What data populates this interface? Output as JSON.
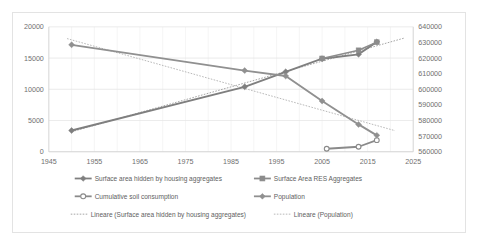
{
  "figure": {
    "background_color": "#ffffff",
    "border_color": "#e3e3e3"
  },
  "chart_data": {
    "type": "line",
    "title": "",
    "subtitle": "",
    "xlabel": "",
    "ylabel": "",
    "y2label": "",
    "xlim": [
      1945,
      2025
    ],
    "xticks": [
      1945,
      1955,
      1965,
      1975,
      1985,
      1995,
      2005,
      2015,
      2025
    ],
    "xticklabels": [
      "1945",
      "1955",
      "1965",
      "1975",
      "1985",
      "1995",
      "2005",
      "2015",
      "2025"
    ],
    "ylim": [
      0,
      20000
    ],
    "yticks": [
      0,
      5000,
      10000,
      15000,
      20000
    ],
    "yticklabels": [
      "0",
      "5000",
      "10000",
      "15000",
      "20000"
    ],
    "y2lim": [
      560000,
      640000
    ],
    "y2ticks": [
      560000,
      570000,
      580000,
      590000,
      600000,
      610000,
      620000,
      630000,
      640000
    ],
    "y2ticklabels": [
      "560000",
      "570000",
      "580000",
      "590000",
      "600000",
      "610000",
      "620000",
      "630000",
      "640000"
    ],
    "grid": true,
    "grid_axis": "both",
    "legend_position": "bottom",
    "series": [
      {
        "name": "Surface area hidden by housing aggregates",
        "axis": "left",
        "color": "#7f7f7f",
        "line_width": 1.9,
        "marker": "diamond",
        "marker_size": 2.6,
        "x": [
          1950,
          1988,
          1997,
          2005,
          2013,
          2017
        ],
        "values": [
          3400,
          10400,
          12800,
          14900,
          15600,
          17600
        ]
      },
      {
        "name": "Surface Area RES Aggregates",
        "axis": "left",
        "color": "#8c8c8c",
        "line_width": 1.6,
        "marker": "square",
        "marker_size": 2.4,
        "x": [
          2005,
          2013,
          2017
        ],
        "values": [
          14950,
          16250,
          17550
        ]
      },
      {
        "name": "Cumulative soil consumption",
        "axis": "left",
        "color": "#8a8a8a",
        "line_width": 1.8,
        "marker": "circle",
        "marker_size": 2.4,
        "x": [
          2006,
          2013,
          2017
        ],
        "values": [
          480,
          800,
          1850
        ]
      },
      {
        "name": "Population",
        "axis": "right",
        "color": "#909090",
        "line_width": 1.9,
        "marker": "diamond",
        "marker_size": 2.6,
        "x": [
          1950,
          1988,
          1997,
          2005,
          2013,
          2017
        ],
        "values": [
          628500,
          612000,
          608500,
          592500,
          577500,
          570500
        ]
      }
    ],
    "trendlines": [
      {
        "name": "Lineare (Surface area hidden by housing aggregates)",
        "axis": "left",
        "color": "#9a9a9a",
        "x": [
          1950,
          2023
        ],
        "values": [
          3200,
          18200
        ]
      },
      {
        "name": "Lineare (Population)",
        "axis": "right",
        "color": "#b0b0b0",
        "x": [
          1949,
          2021
        ],
        "values": [
          632500,
          573500
        ]
      }
    ],
    "legend": [
      {
        "label": "Surface area hidden by housing aggregates",
        "style": "line-marker",
        "marker": "diamond",
        "color": "#7f7f7f"
      },
      {
        "label": "Surface Area RES Aggregates",
        "style": "line-marker",
        "marker": "square",
        "color": "#8c8c8c"
      },
      {
        "label": "Cumulative soil consumption",
        "style": "line-marker",
        "marker": "circle",
        "color": "#8a8a8a"
      },
      {
        "label": "Population",
        "style": "line-marker",
        "marker": "diamond",
        "color": "#909090"
      },
      {
        "label": "Lineare (Surface area hidden by housing aggregates)",
        "style": "dotted",
        "marker": "none",
        "color": "#9a9a9a"
      },
      {
        "label": "Lineare (Population)",
        "style": "dotted",
        "marker": "none",
        "color": "#b0b0b0"
      }
    ]
  }
}
